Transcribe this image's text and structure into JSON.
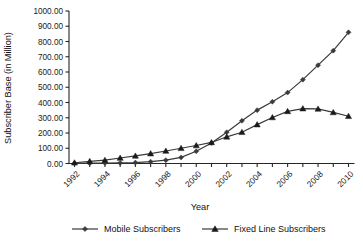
{
  "chart_data": {
    "type": "line",
    "title": "",
    "xlabel": "Year",
    "ylabel": "Subscriber Base (in Million)",
    "x": [
      1992,
      1993,
      1994,
      1995,
      1996,
      1997,
      1998,
      1999,
      2000,
      2001,
      2002,
      2003,
      2004,
      2005,
      2006,
      2007,
      2008,
      2009,
      2010
    ],
    "xtick_labels": [
      "1992",
      "1994",
      "1996",
      "1998",
      "2000",
      "2002",
      "2004",
      "2006",
      "2008",
      "2010"
    ],
    "xtick_values": [
      1992,
      1994,
      1996,
      1998,
      2000,
      2002,
      2004,
      2006,
      2008,
      2010
    ],
    "ytick_labels": [
      "0.00",
      "100.00",
      "200.00",
      "300.00",
      "400.00",
      "500.00",
      "600.00",
      "700.00",
      "800.00",
      "900.00",
      "1000.00"
    ],
    "ytick_values": [
      0,
      100,
      200,
      300,
      400,
      500,
      600,
      700,
      800,
      900,
      1000
    ],
    "ylim": [
      0,
      1000
    ],
    "xlim": [
      1992,
      2010
    ],
    "grid": false,
    "legend_position": "bottom",
    "series": [
      {
        "name": "Mobile Subscribers",
        "marker": "diamond",
        "color": "#3a3a3a",
        "values": [
          1,
          2,
          3,
          4,
          6,
          12,
          22,
          40,
          80,
          135,
          205,
          280,
          350,
          405,
          465,
          550,
          645,
          740,
          860
        ]
      },
      {
        "name": "Fixed Line Subscribers",
        "marker": "triangle",
        "color": "#1a1a1a",
        "values": [
          5,
          14,
          22,
          36,
          50,
          65,
          82,
          100,
          118,
          138,
          175,
          205,
          255,
          302,
          342,
          360,
          358,
          335,
          310
        ]
      }
    ]
  },
  "legend": {
    "items": [
      {
        "label": "Mobile Subscribers",
        "marker": "diamond"
      },
      {
        "label": "Fixed Line Subscribers",
        "marker": "triangle"
      }
    ]
  },
  "axes": {
    "y_title": "Subscriber Base (in Million)",
    "x_title": "Year"
  }
}
